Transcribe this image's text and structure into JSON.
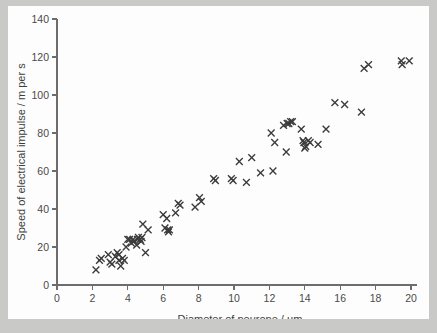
{
  "figure": {
    "background_color": "#fdfdfd",
    "page_background_color": "#c9c9c7",
    "axis_color": "#6d6d6d",
    "marker_color": "#3b3b3b",
    "marker_symbol": "x"
  },
  "chart_data": {
    "type": "scatter",
    "title": "",
    "subtitle": "",
    "xlabel": "Diameter of neurone / µm",
    "ylabel": "Speed of electrical impulse / m per s",
    "xlim": [
      0,
      20
    ],
    "ylim": [
      0,
      140
    ],
    "xticks": [
      0,
      2,
      4,
      6,
      8,
      10,
      12,
      14,
      16,
      18,
      20
    ],
    "xtick_labels": [
      "0",
      "2",
      "4",
      "6",
      "8",
      "10",
      "12",
      "14",
      "16",
      "18",
      "20"
    ],
    "yticks": [
      0,
      20,
      40,
      60,
      80,
      100,
      120,
      140
    ],
    "ytick_labels": [
      "0",
      "20",
      "40",
      "60",
      "80",
      "100",
      "120",
      "140"
    ],
    "grid": false,
    "legend": null,
    "legend_position": "none",
    "series": [
      {
        "name": "Neurone conduction velocity",
        "marker": "x",
        "color": "#3b3b3b",
        "points": [
          [
            2.2,
            8
          ],
          [
            2.4,
            13
          ],
          [
            2.5,
            14
          ],
          [
            2.9,
            16
          ],
          [
            3.0,
            12
          ],
          [
            3.1,
            11
          ],
          [
            3.3,
            15
          ],
          [
            3.4,
            17
          ],
          [
            3.5,
            16
          ],
          [
            3.5,
            13
          ],
          [
            3.6,
            10
          ],
          [
            3.7,
            14
          ],
          [
            3.8,
            13
          ],
          [
            3.9,
            20
          ],
          [
            4.0,
            24
          ],
          [
            4.1,
            24
          ],
          [
            4.2,
            22
          ],
          [
            4.3,
            24
          ],
          [
            4.35,
            23
          ],
          [
            4.5,
            21
          ],
          [
            4.55,
            24
          ],
          [
            4.6,
            25
          ],
          [
            4.7,
            24
          ],
          [
            4.75,
            23
          ],
          [
            4.8,
            25
          ],
          [
            4.85,
            32
          ],
          [
            5.0,
            17
          ],
          [
            5.15,
            29
          ],
          [
            6.0,
            37
          ],
          [
            6.1,
            30
          ],
          [
            6.2,
            35
          ],
          [
            6.25,
            29
          ],
          [
            6.3,
            28
          ],
          [
            6.35,
            29
          ],
          [
            6.7,
            38
          ],
          [
            6.85,
            43
          ],
          [
            6.95,
            42
          ],
          [
            7.8,
            41
          ],
          [
            8.05,
            46
          ],
          [
            8.15,
            44
          ],
          [
            8.85,
            56
          ],
          [
            8.95,
            55
          ],
          [
            9.85,
            56
          ],
          [
            9.95,
            55
          ],
          [
            10.3,
            65
          ],
          [
            10.7,
            54
          ],
          [
            11.0,
            67
          ],
          [
            11.5,
            59
          ],
          [
            12.1,
            80
          ],
          [
            12.2,
            60
          ],
          [
            12.3,
            75
          ],
          [
            12.8,
            84
          ],
          [
            12.95,
            70
          ],
          [
            13.0,
            85
          ],
          [
            13.1,
            85
          ],
          [
            13.2,
            86
          ],
          [
            13.3,
            86
          ],
          [
            13.8,
            82
          ],
          [
            13.9,
            76
          ],
          [
            13.95,
            75
          ],
          [
            14.0,
            72
          ],
          [
            14.05,
            73
          ],
          [
            14.2,
            76
          ],
          [
            14.3,
            75
          ],
          [
            14.75,
            74
          ],
          [
            15.2,
            82
          ],
          [
            15.7,
            96
          ],
          [
            16.25,
            95
          ],
          [
            17.2,
            91
          ],
          [
            17.35,
            114
          ],
          [
            17.6,
            116
          ],
          [
            19.45,
            118
          ],
          [
            19.5,
            116
          ],
          [
            19.9,
            118
          ]
        ]
      }
    ]
  }
}
